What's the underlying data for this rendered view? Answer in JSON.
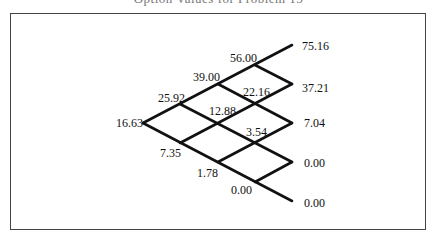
{
  "title": "Option Values for Problem 15",
  "diagram": {
    "type": "binomial-tree",
    "steps": 4,
    "root": "16.63",
    "nodes": {
      "step1": [
        "25.92",
        "7.35"
      ],
      "step2": [
        "39.00",
        "12.88",
        "1.78"
      ],
      "step3": [
        "56.00",
        "22.16",
        "3.54",
        "0.00"
      ],
      "step4": [
        "75.16",
        "37.21",
        "7.04",
        "0.00",
        "0.00"
      ]
    }
  }
}
